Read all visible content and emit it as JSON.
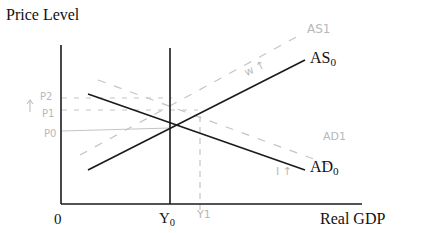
{
  "diagram": {
    "axes": {
      "y_label": "Price Level",
      "x_label": "Real GDP",
      "origin_label": "0"
    },
    "curves": {
      "as0": {
        "label": "AS",
        "sub": "0"
      },
      "ad0": {
        "label": "AD",
        "sub": "0"
      },
      "as1": {
        "label": "AS1",
        "style": "dashed-handwritten"
      },
      "ad1": {
        "label": "AD1",
        "style": "dashed-handwritten"
      }
    },
    "x_ticks": {
      "y0": {
        "label": "Y",
        "sub": "0"
      },
      "y1": {
        "label": "Y1",
        "style": "handwritten"
      }
    },
    "price_levels": {
      "p2": "P2",
      "p1": "P1",
      "p0": "P0",
      "arrow": "↑"
    },
    "annotations": {
      "w_up": "w ↑",
      "i_up": "I ↑"
    },
    "colors": {
      "ink": "#111111",
      "pencil": "#bdbdbd"
    }
  }
}
